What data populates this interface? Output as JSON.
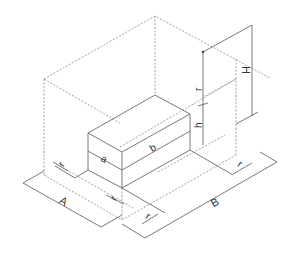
{
  "diagram": {
    "type": "isometric dimension drawing",
    "labels": {
      "A": "A",
      "B": "B",
      "H": "H",
      "a": "a",
      "b": "b",
      "h": "h",
      "r_top": "r",
      "r_left": "r",
      "r_front_left": "r",
      "r_front_right": "r",
      "r_right": "r"
    },
    "colors": {
      "line": "#6a6a6a",
      "dashed": "#8a8a8a",
      "text": "#333333",
      "background": "#ffffff"
    }
  }
}
